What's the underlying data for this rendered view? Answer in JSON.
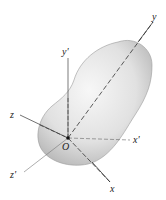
{
  "figure": {
    "origin_label": "O",
    "axes": {
      "x": "x",
      "y": "y",
      "z": "z",
      "x_prime": "x'",
      "y_prime": "y'",
      "z_prime": "z'"
    },
    "colors": {
      "body_light": "#f4f4f4",
      "body_mid": "#d8d8d8",
      "body_dark": "#a9a9a9",
      "axis": "#333333"
    }
  }
}
